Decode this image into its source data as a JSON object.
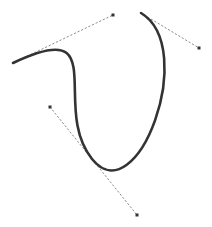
{
  "canvas": {
    "width": 212,
    "height": 227,
    "background": "#ffffff"
  },
  "curve": {
    "stroke": "#333333",
    "stroke_width": 2.6,
    "segments": [
      {
        "start": [
          13,
          63
        ],
        "c1": [
          113,
          15
        ],
        "c2": [
          50,
          107
        ],
        "end": [
          92,
          159
        ]
      },
      {
        "start": [
          92,
          159
        ],
        "c1": [
          137,
          215
        ],
        "c2": [
          199,
          48
        ],
        "end": [
          141,
          13
        ]
      }
    ]
  },
  "handles": {
    "stroke": "#8a8a8a",
    "stroke_width": 1,
    "lines": [
      {
        "from": [
          13,
          63
        ],
        "to": [
          113,
          15
        ]
      },
      {
        "from": [
          50,
          107
        ],
        "to": [
          137,
          215
        ]
      },
      {
        "from": [
          141,
          13
        ],
        "to": [
          199,
          48
        ]
      }
    ]
  },
  "control_points": {
    "fill": "#333333",
    "size": 3,
    "points": [
      [
        113,
        15
      ],
      [
        199,
        48
      ],
      [
        50,
        107
      ],
      [
        137,
        215
      ]
    ]
  }
}
